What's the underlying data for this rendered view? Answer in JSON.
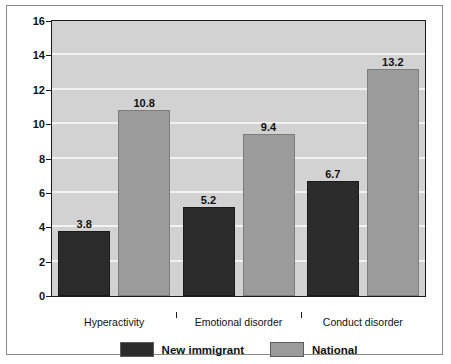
{
  "chart_data": {
    "type": "bar",
    "title": "",
    "xlabel": "",
    "ylabel": "Percent",
    "ylim": [
      0,
      16
    ],
    "yticks": [
      0,
      2,
      4,
      6,
      8,
      10,
      12,
      14,
      16
    ],
    "ytick_labels": [
      "0",
      "2",
      "4",
      "6",
      "8",
      "10",
      "12",
      "14",
      "16"
    ],
    "grid": true,
    "grid_color": "#f2f2f2",
    "plot_background": "#d2d2d2",
    "legend_position": "bottom-center",
    "categories": [
      "Hyperactivity",
      "Emotional disorder",
      "Conduct disorder"
    ],
    "series": [
      {
        "name": "New immigrant",
        "color": "#2c2c2c",
        "values": [
          3.8,
          5.2,
          6.7
        ],
        "labels": [
          "3.8",
          "5.2",
          "6.7"
        ]
      },
      {
        "name": "National",
        "color": "#9b9b9b",
        "values": [
          10.8,
          9.4,
          13.2
        ],
        "labels": [
          "10.8",
          "9.4",
          "13.2"
        ]
      }
    ]
  },
  "legend": {
    "items": [
      {
        "label": "New immigrant",
        "color": "#2c2c2c"
      },
      {
        "label": "National",
        "color": "#9b9b9b"
      }
    ]
  }
}
